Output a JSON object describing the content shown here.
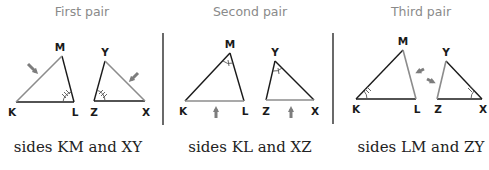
{
  "colors": {
    "line": "#1a1a1a",
    "highlight": "#8c8c8c",
    "arrow": "#7d7d7d",
    "header_text": "#8a8a8a",
    "caption_text": "#222222"
  },
  "panels": [
    {
      "header": "First pair",
      "caption": "sides KM and XY",
      "triangle1": {
        "vertices": [
          "K",
          "L",
          "M"
        ],
        "highlighted_side": "KM",
        "angle_mark": "L (triple arc)"
      },
      "triangle2": {
        "vertices": [
          "Z",
          "X",
          "Y"
        ],
        "highlighted_side": "XY",
        "angle_mark": "Z (triple arc)"
      }
    },
    {
      "header": "Second pair",
      "caption": "sides KL and XZ",
      "triangle1": {
        "vertices": [
          "K",
          "L",
          "M"
        ],
        "highlighted_side": "KL",
        "angle_mark": "M (single arc)"
      },
      "triangle2": {
        "vertices": [
          "Z",
          "X",
          "Y"
        ],
        "highlighted_side": "XZ",
        "angle_mark": "Y (single arc)"
      }
    },
    {
      "header": "Third pair",
      "caption": "sides LM and ZY",
      "triangle1": {
        "vertices": [
          "K",
          "L",
          "M"
        ],
        "highlighted_side": "LM",
        "angle_mark": "K (double arc)"
      },
      "triangle2": {
        "vertices": [
          "Z",
          "X",
          "Y"
        ],
        "highlighted_side": "ZY",
        "angle_mark": "X (double arc)"
      }
    }
  ],
  "labels": {
    "p1": {
      "M": "M",
      "K": "K",
      "L": "L",
      "Y": "Y",
      "Z": "Z",
      "X": "X"
    },
    "p2": {
      "M": "M",
      "K": "K",
      "L": "L",
      "Y": "Y",
      "Z": "Z",
      "X": "X"
    },
    "p3": {
      "M": "M",
      "K": "K",
      "L": "L",
      "Y": "Y",
      "Z": "Z",
      "X": "X"
    }
  }
}
